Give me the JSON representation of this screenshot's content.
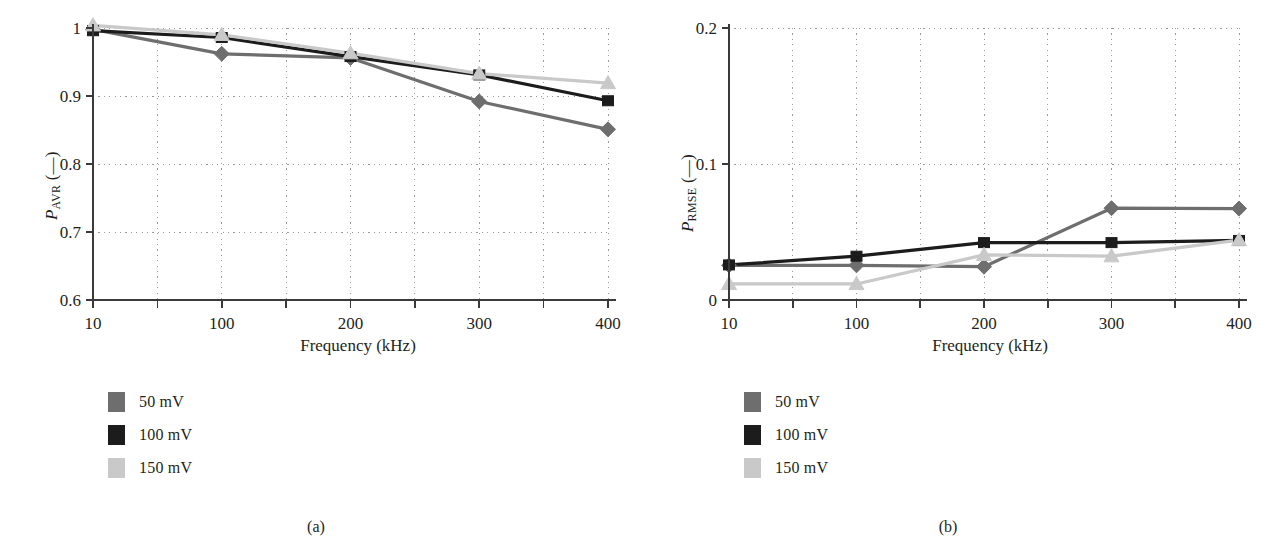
{
  "figure": {
    "panels": [
      {
        "id": "panel-a",
        "subcaption": "(a)",
        "legend": [
          {
            "label": "50 mV",
            "color": "#6e6e6e"
          },
          {
            "label": "100 mV",
            "color": "#1c1c1c"
          },
          {
            "label": "150 mV",
            "color": "#c9c9c9"
          }
        ]
      },
      {
        "id": "panel-b",
        "subcaption": "(b)",
        "legend": [
          {
            "label": "50 mV",
            "color": "#6e6e6e"
          },
          {
            "label": "100 mV",
            "color": "#1c1c1c"
          },
          {
            "label": "150 mV",
            "color": "#c9c9c9"
          }
        ]
      }
    ]
  },
  "chart_data": [
    {
      "type": "line",
      "title": "",
      "panel": "(a)",
      "xlabel": "Frequency (kHz)",
      "ylabel": "P_AVR (—)",
      "ylabel_base": "P",
      "ylabel_sub": "AVR",
      "ylabel_unit": "(—)",
      "categories": [
        "10",
        "100",
        "200",
        "300",
        "400"
      ],
      "x": [
        10,
        100,
        200,
        300,
        400
      ],
      "xtick_labels": [
        "10",
        "100",
        "200",
        "300",
        "400"
      ],
      "ytick_labels": [
        "0.6",
        "0.7",
        "0.8",
        "0.9",
        "1"
      ],
      "yticks": [
        0.6,
        0.7,
        0.8,
        0.9,
        1.0
      ],
      "ylim": [
        0.6,
        1.0
      ],
      "grid": true,
      "grid_style": "dotted",
      "legend_position": "below-left",
      "series": [
        {
          "name": "50 mV",
          "color": "#6e6e6e",
          "marker": "diamond",
          "values": [
            0.998,
            0.962,
            0.956,
            0.892,
            0.851
          ]
        },
        {
          "name": "100 mV",
          "color": "#1c1c1c",
          "marker": "square",
          "values": [
            0.996,
            0.986,
            0.958,
            0.931,
            0.893
          ]
        },
        {
          "name": "150 mV",
          "color": "#c9c9c9",
          "marker": "triangle",
          "values": [
            1.004,
            0.99,
            0.963,
            0.933,
            0.919
          ]
        }
      ]
    },
    {
      "type": "line",
      "title": "",
      "panel": "(b)",
      "xlabel": "Frequency (kHz)",
      "ylabel": "P_RMSE (—)",
      "ylabel_base": "P",
      "ylabel_sub": "RMSE",
      "ylabel_unit": "(—)",
      "categories": [
        "10",
        "100",
        "200",
        "300",
        "400"
      ],
      "x": [
        10,
        100,
        200,
        300,
        400
      ],
      "xtick_labels": [
        "10",
        "100",
        "200",
        "300",
        "400"
      ],
      "ytick_labels": [
        "0",
        "0.1",
        "0.2"
      ],
      "yticks": [
        0,
        0.1,
        0.2
      ],
      "ylim": [
        0,
        0.2
      ],
      "grid": true,
      "grid_style": "dotted",
      "legend_position": "below-left",
      "series": [
        {
          "name": "50 mV",
          "color": "#6e6e6e",
          "marker": "diamond",
          "values": [
            0.0255,
            0.0255,
            0.0245,
            0.0675,
            0.0672
          ]
        },
        {
          "name": "100 mV",
          "color": "#1c1c1c",
          "marker": "square",
          "values": [
            0.0258,
            0.0322,
            0.0422,
            0.0422,
            0.0438
          ]
        },
        {
          "name": "150 mV",
          "color": "#c9c9c9",
          "marker": "triangle",
          "values": [
            0.0118,
            0.0118,
            0.0332,
            0.0322,
            0.044
          ]
        }
      ]
    }
  ]
}
